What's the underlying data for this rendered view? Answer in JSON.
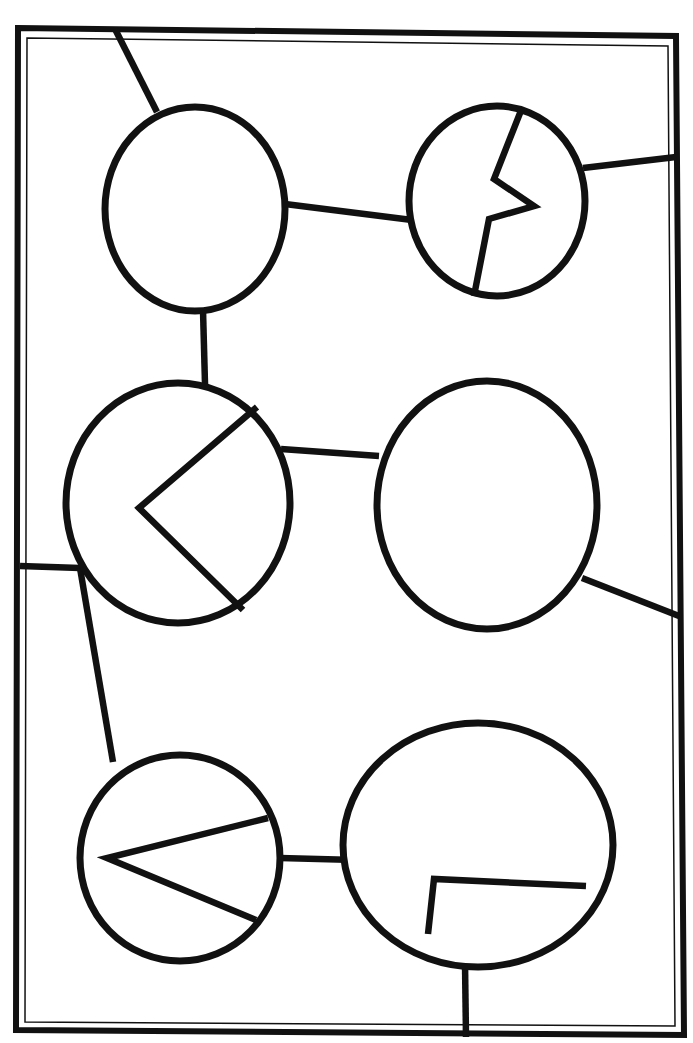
{
  "document": {
    "title": "Hand-drawn node-and-link diagram",
    "description": "Six circular nodes arranged in three rows of two inside a rectangular border frame, joined by straight line edges; four nodes contain angular interior glyphs.",
    "canvas": {
      "width": 693,
      "height": 1043
    },
    "colors": {
      "background": "#ffffff",
      "ink": "#111111"
    }
  },
  "frame": {
    "name": "border-frame",
    "outer_points": "18,28 676,36 684,1035 16,1030",
    "inner_points": "27,38 668,46 675,1026 25,1022",
    "outer_stroke_width": 6,
    "inner_stroke_width": 1.5
  },
  "nodes": [
    {
      "id": "node-top-left",
      "label": "top-left-node",
      "cx": 195,
      "cy": 209,
      "rx": 90,
      "ry": 102,
      "glyph": "empty"
    },
    {
      "id": "node-top-right",
      "label": "top-right-node",
      "cx": 497,
      "cy": 201,
      "rx": 88,
      "ry": 95,
      "glyph": "zigzag"
    },
    {
      "id": "node-middle-left",
      "label": "middle-left-node",
      "cx": 178,
      "cy": 503,
      "rx": 112,
      "ry": 120,
      "glyph": "chevron-wide"
    },
    {
      "id": "node-middle-right",
      "label": "middle-right-node",
      "cx": 487,
      "cy": 505,
      "rx": 110,
      "ry": 124,
      "glyph": "empty"
    },
    {
      "id": "node-bottom-left",
      "label": "bottom-left-node",
      "cx": 180,
      "cy": 858,
      "rx": 100,
      "ry": 103,
      "glyph": "chevron-narrow"
    },
    {
      "id": "node-bottom-right",
      "label": "bottom-right-node",
      "cx": 478,
      "cy": 845,
      "rx": 135,
      "ry": 122,
      "glyph": "right-angle-bracket"
    }
  ],
  "glyph_paths": {
    "zigzag": "M 522,108 L 494,179 L 534,206 L 489,219 L 474,296",
    "chevron_wide": "M 257,407 L 139,508 L 243,610",
    "chevron_narrow": "M 268,818 L 107,858 L 256,920",
    "right_angle_bracket": "M 586,886 L 434,879 L 428,934",
    "none": ""
  },
  "edges": [
    {
      "id": "edge-topleft-topright",
      "label": "top-left to top-right",
      "path": "M 285,204 L 412,220"
    },
    {
      "id": "edge-topright-rightframe",
      "label": "top-right to right frame",
      "path": "M 583,168 L 676,157"
    },
    {
      "id": "edge-topleft-middleleft",
      "label": "top-left to middle-left",
      "path": "M 203,310 L 205,384"
    },
    {
      "id": "edge-middleleft-middleright",
      "label": "middle-left to middle-right",
      "path": "M 281,449 L 379,456"
    },
    {
      "id": "edge-leftframe-middleleft",
      "label": "left frame to middle-left",
      "path": "M 20,566 L 80,568"
    },
    {
      "id": "edge-middleleft-bottomleft",
      "label": "middle-left to bottom-left",
      "path": "M 80,568 L 113,762"
    },
    {
      "id": "edge-middleright-rightframe",
      "label": "middle-right to right frame",
      "path": "M 582,578 L 679,616"
    },
    {
      "id": "edge-bottomleft-bottomright",
      "label": "bottom-left to bottom-right",
      "path": "M 280,858 L 356,860"
    },
    {
      "id": "edge-bottomright-bottomframe",
      "label": "bottom-right to bottom frame",
      "path": "M 465,963 L 466,1037"
    },
    {
      "id": "edge-topleft-topframe",
      "label": "top-left to top frame",
      "path": "M 115,29 L 157,112"
    }
  ]
}
